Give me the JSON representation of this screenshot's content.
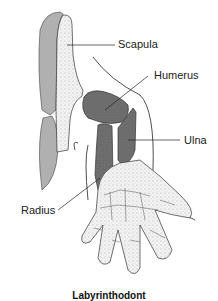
{
  "diagram": {
    "labels": {
      "scapula": "Scapula",
      "humerus": "Humerus",
      "ulna": "Ulna",
      "radius": "Radius"
    },
    "caption": "Labyrinthodont",
    "colors": {
      "dark_bone": "#6e6e6e",
      "light_bone": "#b0b0b0",
      "stippled": "#eeeeee",
      "outline": "#222222"
    }
  }
}
